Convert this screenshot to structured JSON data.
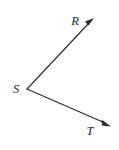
{
  "figure": {
    "kind": "geometry-angle-diagram",
    "background_color": "#ffffff",
    "stroke_color": "#2b2b2b",
    "label_color": "#1f1f1f",
    "width": 119,
    "height": 150,
    "vertex": {
      "name": "S",
      "label": "S",
      "x": 27,
      "y": 89,
      "label_x": 16,
      "label_y": 92
    },
    "rays": [
      {
        "name": "ray-SR",
        "endpoint_label": "R",
        "from_x": 27,
        "from_y": 89,
        "to_x": 93,
        "to_y": 19,
        "label_x": 75,
        "label_y": 25,
        "arrow": true
      },
      {
        "name": "ray-ST",
        "endpoint_label": "T",
        "from_x": 27,
        "from_y": 89,
        "to_x": 110,
        "to_y": 126,
        "label_x": 90,
        "label_y": 134,
        "arrow": true
      }
    ],
    "labels": {
      "r": "R",
      "s": "S",
      "t": "T"
    }
  }
}
